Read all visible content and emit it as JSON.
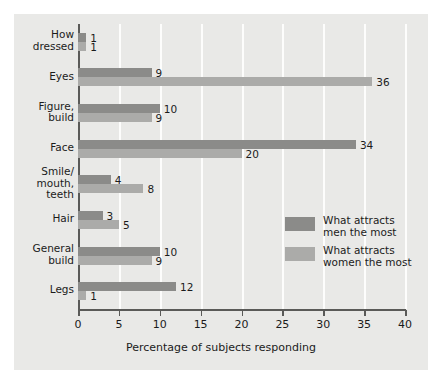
{
  "chart_data": {
    "type": "bar",
    "orientation": "horizontal",
    "title": "",
    "xlabel": "Percentage of subjects responding",
    "ylabel": "",
    "xlim": [
      0,
      40
    ],
    "xticks": [
      0,
      5,
      10,
      15,
      20,
      25,
      30,
      35,
      40
    ],
    "grid": "vertical",
    "legend_position": "inside-right-lower",
    "categories": [
      "How\ndressed",
      "Eyes",
      "Figure,\nbuild",
      "Face",
      "Smile/\nmouth,\nteeth",
      "Hair",
      "General\nbuild",
      "Legs"
    ],
    "category_labels": [
      [
        "How",
        "dressed"
      ],
      [
        "Eyes"
      ],
      [
        "Figure,",
        "build"
      ],
      [
        "Face"
      ],
      [
        "Smile/",
        "mouth,",
        "teeth"
      ],
      [
        "Hair"
      ],
      [
        "General",
        "build"
      ],
      [
        "Legs"
      ]
    ],
    "series": [
      {
        "name": "What attracts men the most",
        "color": "#8b8b89",
        "values": [
          1,
          9,
          10,
          34,
          4,
          3,
          10,
          12
        ]
      },
      {
        "name": "What attracts women the most",
        "color": "#ababa9",
        "values": [
          1,
          36,
          9,
          20,
          8,
          5,
          9,
          1
        ]
      }
    ]
  },
  "legend": {
    "entries": [
      {
        "label_line1": "What attracts",
        "label_line2": "men the most",
        "color": "#8b8b89"
      },
      {
        "label_line1": "What attracts",
        "label_line2": "women the most",
        "color": "#ababa9"
      }
    ]
  },
  "colors": {
    "panel_background": "#e9e9e7",
    "page_background": "#ffffff",
    "gridline": "#fdfdfc",
    "axis": "#5a5a58",
    "text": "#1b1b1b"
  }
}
